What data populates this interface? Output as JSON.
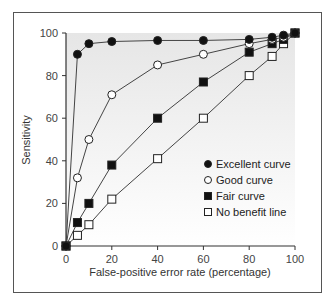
{
  "chart_data": {
    "type": "line",
    "title": "",
    "xlabel": "False-positive error rate (percentage)",
    "ylabel": "Sensitivity",
    "xlim": [
      0,
      100
    ],
    "ylim": [
      0,
      100
    ],
    "xticks": [
      0,
      20,
      40,
      60,
      80,
      100
    ],
    "yticks": [
      0,
      20,
      40,
      60,
      80,
      100
    ],
    "grid": false,
    "legend_position": "lower right",
    "x": [
      0,
      5,
      10,
      20,
      40,
      60,
      80,
      90,
      95,
      100
    ],
    "series": [
      {
        "name": "Excellent curve",
        "marker": "filled-circle",
        "values": [
          0,
          90,
          95,
          96,
          96.5,
          96.5,
          97,
          98,
          99,
          100
        ]
      },
      {
        "name": "Good curve",
        "marker": "open-circle",
        "values": [
          0,
          32,
          50,
          71,
          85,
          90,
          95,
          97,
          98,
          100
        ]
      },
      {
        "name": "Fair curve",
        "marker": "filled-square",
        "values": [
          0,
          11,
          20,
          38,
          60,
          77,
          91,
          95,
          97,
          100
        ]
      },
      {
        "name": "No benefit line",
        "marker": "open-square",
        "values": [
          0,
          5,
          10,
          22,
          41,
          60,
          80,
          89,
          95,
          100
        ]
      }
    ]
  },
  "legend": {
    "items": [
      "Excellent curve",
      "Good curve",
      "Fair curve",
      "No benefit line"
    ]
  },
  "axes": {
    "xlabel": "False-positive error rate (percentage)",
    "ylabel": "Sensitivity"
  }
}
